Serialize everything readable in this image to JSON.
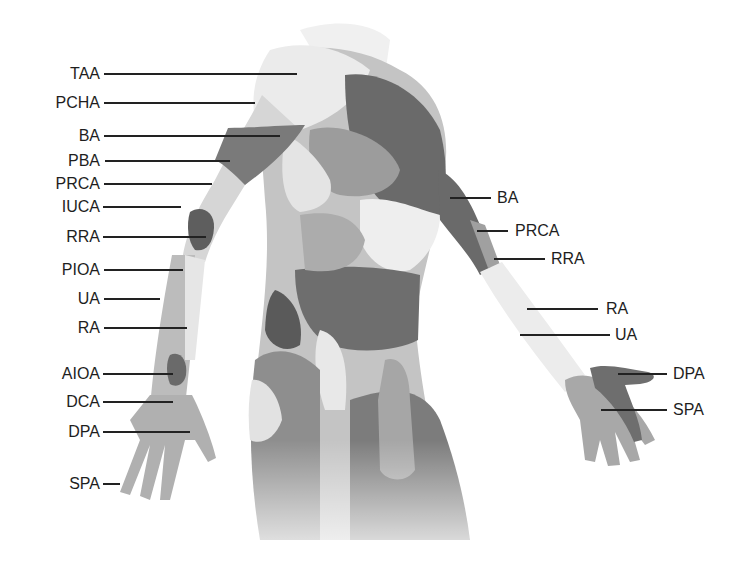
{
  "diagram": {
    "colors": {
      "background": "#ffffff",
      "label": "#1e1e1e",
      "leader": "#222222",
      "light": "#e8e8e8",
      "mid": "#b4b4b4",
      "dark": "#7a7a7a",
      "darker": "#5e5e5e"
    },
    "left_labels": [
      {
        "text": "TAA",
        "y": 74,
        "x2": 297
      },
      {
        "text": "PCHA",
        "y": 103,
        "x2": 255
      },
      {
        "text": "BA",
        "y": 136,
        "x2": 280
      },
      {
        "text": "PBA",
        "y": 161,
        "x2": 230
      },
      {
        "text": "PRCA",
        "y": 184,
        "x2": 212
      },
      {
        "text": "IUCA",
        "y": 207,
        "x2": 181
      },
      {
        "text": "RRA",
        "y": 237,
        "x2": 206
      },
      {
        "text": "PIOA",
        "y": 270,
        "x2": 183
      },
      {
        "text": "UA",
        "y": 299,
        "x2": 160
      },
      {
        "text": "RA",
        "y": 328,
        "x2": 187
      },
      {
        "text": "AIOA",
        "y": 374,
        "x2": 173
      },
      {
        "text": "DCA",
        "y": 402,
        "x2": 173
      },
      {
        "text": "DPA",
        "y": 432,
        "x2": 190
      },
      {
        "text": "SPA",
        "y": 484,
        "x2": 120
      }
    ],
    "right_labels": [
      {
        "text": "BA",
        "y": 198,
        "x1": 450,
        "x2": 491
      },
      {
        "text": "PRCA",
        "y": 231,
        "x1": 477,
        "x2": 508
      },
      {
        "text": "RRA",
        "y": 259,
        "x1": 494,
        "x2": 545
      },
      {
        "text": "RA",
        "y": 309,
        "x1": 527,
        "x2": 598
      },
      {
        "text": "UA",
        "y": 335,
        "x1": 520,
        "x2": 610
      },
      {
        "text": "DPA",
        "y": 374,
        "x1": 618,
        "x2": 667
      },
      {
        "text": "SPA",
        "y": 410,
        "x1": 601,
        "x2": 667
      }
    ]
  }
}
